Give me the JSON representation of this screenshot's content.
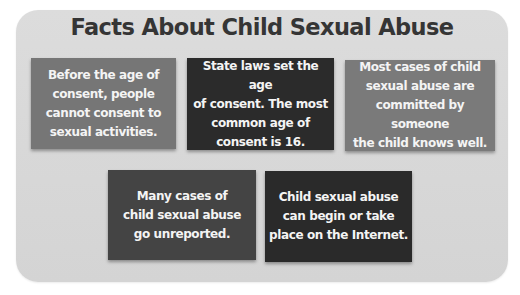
{
  "title": "Facts About Child Sexual Abuse",
  "colors": {
    "panel": "#d8d8d8",
    "title": "#353535",
    "box_medium": "#767676",
    "box_dark": "#2b2b2b",
    "box_charcoal": "#444444",
    "box_text": "#f4f4f4"
  },
  "facts": [
    {
      "lines": [
        "Before the age of",
        "consent, people",
        "cannot consent to",
        "sexual activities."
      ]
    },
    {
      "lines": [
        "State laws set the age",
        "of consent. The most",
        "common age of",
        "consent is 16."
      ]
    },
    {
      "lines": [
        "Most cases of child",
        "sexual abuse are",
        "committed by someone",
        "the child knows well."
      ]
    },
    {
      "lines": [
        "Many cases of",
        "child sexual abuse",
        "go unreported."
      ]
    },
    {
      "lines": [
        "Child sexual abuse",
        "can begin or take",
        "place on the Internet."
      ]
    }
  ]
}
